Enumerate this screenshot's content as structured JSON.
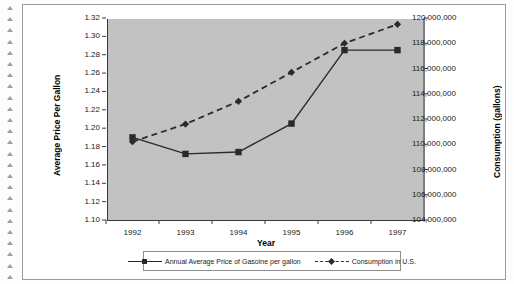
{
  "chart_data": {
    "type": "line",
    "title": "",
    "xlabel": "Year",
    "categories": [
      "1992",
      "1993",
      "1994",
      "1995",
      "1996",
      "1997"
    ],
    "grid": false,
    "legend_position": "bottom",
    "plot_background": "#c2c2c2",
    "series": [
      {
        "name": "Annual Average Price of Gasoline per gallon",
        "axis": "left",
        "marker": "square",
        "line_style": "solid",
        "color": "#2a2a2a",
        "values": [
          1.19,
          1.172,
          1.174,
          1.205,
          1.285,
          1.285
        ]
      },
      {
        "name": "Consumption in U.S.",
        "axis": "right",
        "marker": "diamond",
        "line_style": "dashed",
        "color": "#2a2a2a",
        "values": [
          110200000,
          111600000,
          113400000,
          115700000,
          118000000,
          119500000
        ]
      }
    ],
    "y_left": {
      "label": "Average Price Per Gallon",
      "lim": [
        1.1,
        1.32
      ],
      "step": 0.02,
      "ticks": [
        "1.32",
        "1.30",
        "1.28",
        "1.26",
        "1.24",
        "1.22",
        "1.20",
        "1.18",
        "1.16",
        "1.14",
        "1.12",
        "1.10"
      ]
    },
    "y_right": {
      "label": "Consumption (gallons)",
      "lim": [
        104000000,
        120000000
      ],
      "step": 2000000,
      "ticks": [
        "120,000,000",
        "118,000,000",
        "116,000,000",
        "114,000,000",
        "112,000,000",
        "110,000,000",
        "108,000,000",
        "106,000,000",
        "104,000,000"
      ]
    },
    "legend": [
      {
        "label": "Annual Average Price of Gasoine per gallon",
        "marker": "square",
        "line_style": "solid"
      },
      {
        "label": "Consumption in U.S.",
        "marker": "diamond",
        "line_style": "dashed"
      }
    ]
  }
}
